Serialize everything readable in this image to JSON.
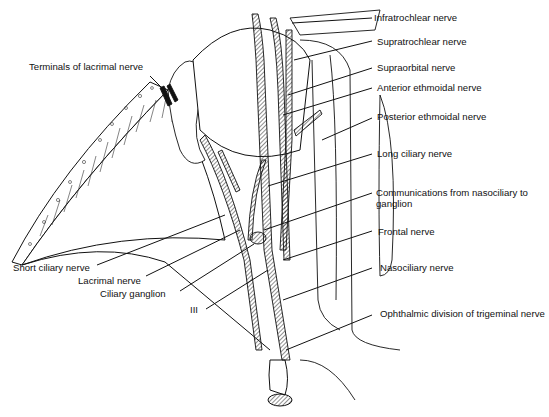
{
  "figure": {
    "colors": {
      "line": "#111111",
      "hatch": "#222222",
      "background": "#ffffff",
      "fill": "#ffffff"
    }
  },
  "labels_right": [
    {
      "id": "infratrochlear",
      "text": "Infratrochlear nerve"
    },
    {
      "id": "supratrochlear",
      "text": "Supratrochlear nerve"
    },
    {
      "id": "supraorbital",
      "text": "Supraorbital nerve"
    },
    {
      "id": "anterior-ethmoidal",
      "text": "Anterior ethmoidal nerve"
    },
    {
      "id": "posterior-ethmoidal",
      "text": "Posterior ethmoidal nerve"
    },
    {
      "id": "long-ciliary",
      "text": "Long ciliary nerve"
    },
    {
      "id": "communications",
      "text": "Communications from nasociliary to ganglion"
    },
    {
      "id": "frontal",
      "text": "Frontal nerve"
    },
    {
      "id": "nasociliary",
      "text": "Nasociliary nerve"
    },
    {
      "id": "ophthalmic-division",
      "text": "Ophthalmic division of trigeminal nerve"
    }
  ],
  "labels_left": [
    {
      "id": "terminals-lacrimal",
      "text": "Terminals of lacrimal nerve"
    },
    {
      "id": "short-ciliary",
      "text": "Short ciliary nerve"
    },
    {
      "id": "lacrimal",
      "text": "Lacrimal nerve"
    },
    {
      "id": "ciliary-ganglion",
      "text": "Ciliary ganglion"
    },
    {
      "id": "oculomotor",
      "text": "III"
    }
  ]
}
